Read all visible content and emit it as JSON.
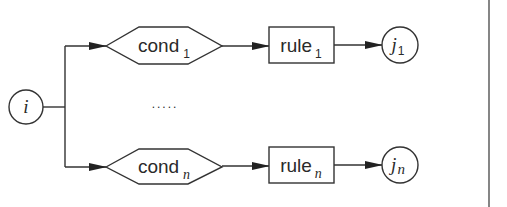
{
  "diagram": {
    "source_node": {
      "label": "i"
    },
    "ellipsis": ".....",
    "branches": [
      {
        "condition": {
          "label": "cond",
          "subscript": "1"
        },
        "rule": {
          "label": "rule",
          "subscript": "1"
        },
        "target": {
          "label": "j",
          "subscript": "1"
        }
      },
      {
        "condition": {
          "label": "cond",
          "subscript": "n"
        },
        "rule": {
          "label": "rule",
          "subscript": "n"
        },
        "target": {
          "label": "j",
          "subscript": "n"
        }
      }
    ]
  }
}
